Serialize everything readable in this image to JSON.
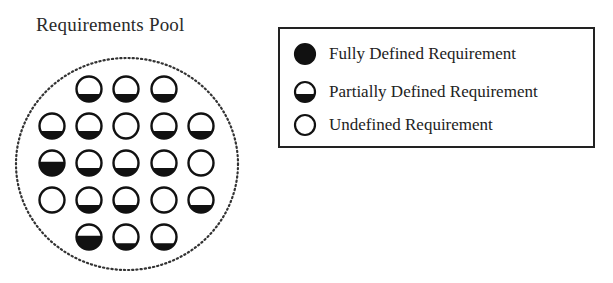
{
  "title": "Requirements Pool",
  "legend": {
    "items": [
      {
        "label": "Fully Defined Requirement",
        "icon": "full-circle-icon",
        "fill": 1.0
      },
      {
        "label": "Partially Defined Requirement",
        "icon": "half-circle-icon",
        "fill": 0.4
      },
      {
        "label": "Undefined Requirement",
        "icon": "empty-circle-icon",
        "fill": 0.0
      }
    ]
  },
  "pool": {
    "boundary": "dotted-circle",
    "rows": [
      {
        "y": 89,
        "cells": [
          {
            "x": 89,
            "fill": 0.3
          },
          {
            "x": 126,
            "fill": 0.3
          },
          {
            "x": 164,
            "fill": 0.3
          }
        ]
      },
      {
        "y": 126,
        "cells": [
          {
            "x": 52,
            "fill": 0.3
          },
          {
            "x": 89,
            "fill": 0.3
          },
          {
            "x": 126,
            "fill": 0.0
          },
          {
            "x": 164,
            "fill": 0.3
          },
          {
            "x": 201,
            "fill": 0.3
          }
        ]
      },
      {
        "y": 163,
        "cells": [
          {
            "x": 52,
            "fill": 0.55
          },
          {
            "x": 89,
            "fill": 0.3
          },
          {
            "x": 126,
            "fill": 0.3
          },
          {
            "x": 164,
            "fill": 0.3
          },
          {
            "x": 201,
            "fill": 0.0
          }
        ]
      },
      {
        "y": 200,
        "cells": [
          {
            "x": 52,
            "fill": 0.0
          },
          {
            "x": 89,
            "fill": 0.3
          },
          {
            "x": 126,
            "fill": 0.3
          },
          {
            "x": 164,
            "fill": 0.0
          },
          {
            "x": 201,
            "fill": 0.3
          }
        ]
      },
      {
        "y": 237,
        "cells": [
          {
            "x": 89,
            "fill": 0.55
          },
          {
            "x": 126,
            "fill": 0.25
          },
          {
            "x": 164,
            "fill": 0.25
          }
        ]
      }
    ]
  }
}
